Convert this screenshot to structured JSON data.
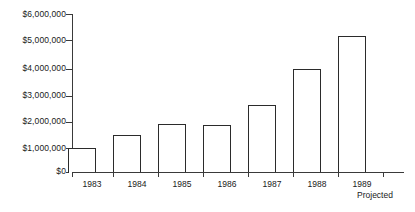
{
  "chart_data": {
    "type": "bar",
    "title": "",
    "subtitle": "",
    "xlabel": "",
    "ylabel": "",
    "categories": [
      "1983",
      "1984",
      "1985",
      "1986",
      "1987",
      "1988",
      "1989"
    ],
    "category_sublabels": [
      "",
      "",
      "",
      "",
      "",
      "",
      "Projected"
    ],
    "values": [
      930000,
      1440000,
      1840000,
      1830000,
      2550000,
      3930000,
      5170000
    ],
    "ylim": [
      0,
      6000000
    ],
    "ytick_values": [
      0,
      1000000,
      2000000,
      3000000,
      4000000,
      5000000,
      6000000
    ],
    "ytick_labels": [
      "$0",
      "$1,000,000",
      "$2,000,000",
      "$3,000,000",
      "$4,000,000",
      "$5,000,000",
      "$6,000,000"
    ],
    "grid": false,
    "legend": false,
    "legend_position": "none",
    "bar_fill_color": "#ffffff",
    "bar_border_color": "#2b2b2b",
    "axis_color": "#3a3a3a",
    "background_color": "#ffffff"
  },
  "axis": {
    "y_labels": {
      "t0": "$0",
      "t1": "$1,000,000",
      "t2": "$2,000,000",
      "t3": "$3,000,000",
      "t4": "$4,000,000",
      "t5": "$5,000,000",
      "t6": "$6,000,000"
    },
    "x_labels": {
      "c0": "1983",
      "c1": "1984",
      "c2": "1985",
      "c3": "1986",
      "c4": "1987",
      "c5": "1988",
      "c6": "1989"
    },
    "x_sublabels": {
      "c6": "Projected"
    }
  }
}
